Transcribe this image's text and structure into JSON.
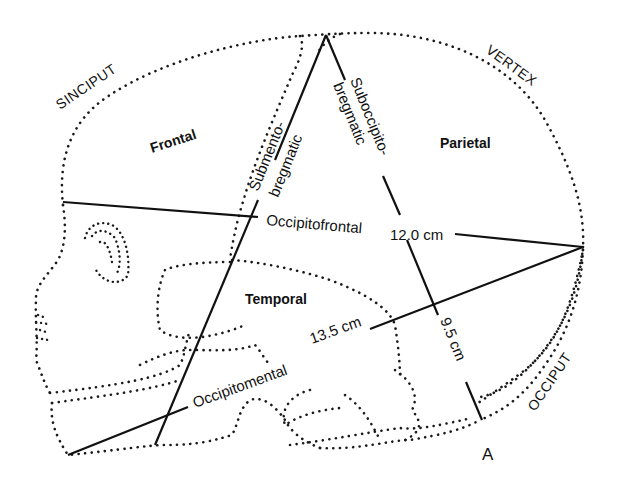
{
  "figure": {
    "panel_label": "A",
    "regions": [
      {
        "id": "frontal",
        "label": "Frontal"
      },
      {
        "id": "parietal",
        "label": "Parietal"
      },
      {
        "id": "temporal",
        "label": "Temporal"
      }
    ],
    "zones": [
      {
        "id": "sinciput",
        "label": "SINCIPUT"
      },
      {
        "id": "vertex",
        "label": "VERTEX"
      },
      {
        "id": "occiput",
        "label": "OCCIPUT"
      }
    ],
    "diameters": [
      {
        "id": "submentobregmatic",
        "label_line1": "Submento-",
        "label_line2": "bregmatic",
        "value": ""
      },
      {
        "id": "suboccipitobregmatic",
        "label_line1": "Suboccipito-",
        "label_line2": "bregmatic",
        "value": "9.5 cm"
      },
      {
        "id": "occipitofrontal",
        "label": "Occipitofrontal",
        "value": "12.0 cm"
      },
      {
        "id": "occipitomental",
        "label": "Occipitomental",
        "value": "13.5 cm"
      }
    ]
  }
}
